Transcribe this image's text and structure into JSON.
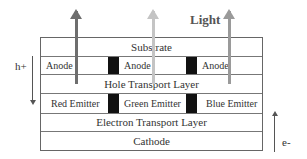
{
  "light_label": "Light",
  "layers": {
    "substrate": "Substrate",
    "anodes": [
      "Anode",
      "Anode",
      "Anode"
    ],
    "htl": "Hole Transport Layer",
    "emitters": [
      "Red Emitter",
      "Green Emitter",
      "Blue Emitter"
    ],
    "etl": "Electron Transport Layer",
    "cathode": "Cathode"
  },
  "carriers": {
    "holes": "h+",
    "electrons": "e-"
  },
  "colors": {
    "red_arrow": "#6e6e6e",
    "green_arrow": "#c4c4c4",
    "blue_arrow": "#9a9a9a",
    "divider": "#111111"
  }
}
